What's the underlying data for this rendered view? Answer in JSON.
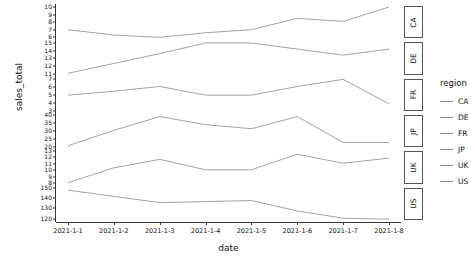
{
  "chart_data": {
    "type": "line",
    "title": "",
    "xlabel": "date",
    "ylabel": "sales_total",
    "grid": false,
    "legend_position": "right",
    "legend_title": "region",
    "facet_by": "region",
    "facet_scales": "free_y",
    "x": [
      "2021-1-1",
      "2021-1-2",
      "2021-1-3",
      "2021-1-4",
      "2021-1-5",
      "2021-1-6",
      "2021-1-7",
      "2021-1-8"
    ],
    "categories": [
      "2021-1-1",
      "2021-1-2",
      "2021-1-3",
      "2021-1-4",
      "2021-1-5",
      "2021-1-6",
      "2021-1-7",
      "2021-1-8"
    ],
    "series": [
      {
        "name": "CA",
        "values": [
          7.0,
          6.3,
          6.0,
          6.6,
          7.0,
          8.5,
          8.1,
          10.0
        ],
        "ylim": [
          5.6,
          10.4
        ],
        "yticks": [
          10,
          9,
          8,
          7,
          6
        ]
      },
      {
        "name": "DE",
        "values": [
          11.0,
          12.3,
          13.6,
          15.0,
          15.0,
          14.2,
          13.4,
          14.2
        ],
        "ylim": [
          10.6,
          15.4
        ],
        "yticks": [
          15,
          14,
          13,
          12,
          11
        ]
      },
      {
        "name": "FR",
        "values": [
          5.0,
          5.5,
          6.1,
          5.0,
          5.0,
          6.1,
          7.0,
          3.9
        ],
        "ylim": [
          2.7,
          7.3
        ],
        "yticks": [
          7,
          6,
          5,
          4,
          3
        ]
      },
      {
        "name": "JP",
        "values": [
          21.0,
          30.5,
          39.0,
          34.0,
          31.5,
          39.0,
          23.0,
          23.0
        ],
        "ylim": [
          18.8,
          41.2
        ],
        "yticks": [
          40,
          35,
          30,
          25,
          20
        ]
      },
      {
        "name": "UK",
        "values": [
          8.0,
          10.3,
          11.6,
          10.0,
          10.0,
          12.4,
          11.0,
          11.8
        ],
        "ylim": [
          7.6,
          13.2
        ],
        "yticks": [
          13,
          12,
          11,
          10,
          9,
          8
        ]
      },
      {
        "name": "US",
        "values": [
          148,
          142,
          136,
          137,
          138,
          128,
          121,
          120
        ],
        "ylim": [
          117,
          152
        ],
        "yticks": [
          150,
          140,
          130,
          120
        ]
      }
    ]
  },
  "axes": {
    "y_title": "sales_total",
    "x_title": "date"
  },
  "legend": {
    "title": "region",
    "items": [
      {
        "label": "CA"
      },
      {
        "label": "DE"
      },
      {
        "label": "FR"
      },
      {
        "label": "JP"
      },
      {
        "label": "UK"
      },
      {
        "label": "US"
      }
    ]
  },
  "facet_strips": [
    {
      "label": "CA"
    },
    {
      "label": "DE"
    },
    {
      "label": "FR"
    },
    {
      "label": "JP"
    },
    {
      "label": "UK"
    },
    {
      "label": "US"
    }
  ],
  "colors": {
    "line": "#8a8a8a",
    "axis": "#333333",
    "text": "#111111",
    "panel_bg": "#ffffff",
    "strip_border": "#555555"
  }
}
